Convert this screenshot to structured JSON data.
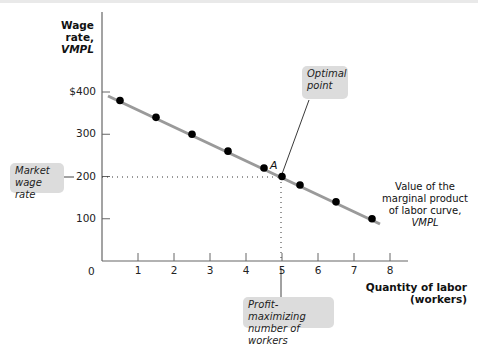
{
  "chart_data": {
    "type": "line",
    "title": "",
    "ylabel": "Wage rate, VMPL",
    "ylabel_line1": "Wage rate,",
    "ylabel_line2": "VMPL",
    "xlabel": "Quantity of labor (workers)",
    "xlabel_line1": "Quantity of labor",
    "xlabel_line2": "(workers)",
    "xlim": [
      0,
      8
    ],
    "ylim": [
      0,
      400
    ],
    "x_ticks": [
      "1",
      "2",
      "3",
      "4",
      "5",
      "6",
      "7",
      "8"
    ],
    "y_ticks": [
      "$400",
      "300",
      "200",
      "100"
    ],
    "origin_label": "0",
    "grid": false,
    "series": [
      {
        "name": "Value of the marginal product of labor curve, VMPL",
        "points": [
          {
            "x": 0.5,
            "y": 380
          },
          {
            "x": 1.5,
            "y": 340
          },
          {
            "x": 2.5,
            "y": 300
          },
          {
            "x": 3.5,
            "y": 260
          },
          {
            "x": 4.5,
            "y": 220
          },
          {
            "x": 5,
            "y": 200
          },
          {
            "x": 5.5,
            "y": 180
          },
          {
            "x": 6.5,
            "y": 140
          },
          {
            "x": 7.5,
            "y": 100
          }
        ],
        "line_color": "#9a9a9a",
        "dot_color": "#000000"
      }
    ],
    "annotations": {
      "point_label": "A",
      "point": {
        "x": 5,
        "y": 200
      },
      "optimal_point": "Optimal point",
      "optimal_line1": "Optimal",
      "optimal_line2": "point",
      "market_wage": "Market wage rate",
      "market_line1": "Market",
      "market_line2": "wage rate",
      "profit_max": "Profit-maximizing number of workers",
      "profit_line1": "Profit-maximizing",
      "profit_line2": "number of workers",
      "curve_label_line1": "Value of the",
      "curve_label_line2": "marginal product",
      "curve_label_line3": "of labor curve,",
      "curve_label_line4": "VMPL"
    }
  }
}
